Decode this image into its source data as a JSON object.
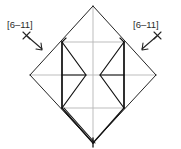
{
  "figure": {
    "type": "origami-folding-step-diagram",
    "background_color": "#ffffff",
    "width": 181,
    "height": 149,
    "stroke_dark": "#1a1a1a",
    "stroke_gray": "#a9a9a9",
    "stroke_mid": "#555555"
  },
  "labels": {
    "left": {
      "text": "[6–11]",
      "x": 7,
      "y": 20
    },
    "right": {
      "text": "[6–11]",
      "x": 133,
      "y": 20
    }
  },
  "annotations": {
    "left_arrow": {
      "name": "repeat-arrow-left",
      "marker": "×",
      "direction": "down-right",
      "from_x": 25,
      "from_y": 34,
      "to_x": 43,
      "to_y": 50
    },
    "right_arrow": {
      "name": "repeat-arrow-right",
      "marker": "×",
      "direction": "down-left",
      "from_x": 155,
      "from_y": 34,
      "to_x": 137,
      "to_y": 50
    }
  },
  "geometry": {
    "outer_diamond": {
      "top": [
        93,
        6
      ],
      "right": [
        156,
        75
      ],
      "bottom": [
        93,
        143
      ],
      "left": [
        30,
        75
      ]
    },
    "construction_lines_color": "#b5b5b5",
    "construction_lines": [
      {
        "name": "vertical-center",
        "x1": 93,
        "y1": 6,
        "x2": 93,
        "y2": 143
      },
      {
        "name": "horizontal-center",
        "x1": 30,
        "y1": 75,
        "x2": 156,
        "y2": 75
      },
      {
        "name": "upper-horizontal",
        "x1": 62,
        "y1": 42,
        "x2": 124,
        "y2": 42
      },
      {
        "name": "lower-horizontal",
        "x1": 62,
        "y1": 108,
        "x2": 124,
        "y2": 108
      },
      {
        "name": "left-vertical",
        "x1": 62,
        "y1": 42,
        "x2": 62,
        "y2": 108
      },
      {
        "name": "right-vertical",
        "x1": 124,
        "y1": 42,
        "x2": 124,
        "y2": 108
      }
    ],
    "left_flap": {
      "spine": {
        "x1": 62,
        "y1": 42,
        "x2": 62,
        "y2": 108
      },
      "kite_outer": [
        [
          62,
          42
        ],
        [
          86,
          75
        ],
        [
          62,
          108
        ]
      ],
      "kite_mid_line": {
        "x1": 62,
        "y1": 75,
        "x2": 86,
        "y2": 75
      }
    },
    "right_flap": {
      "spine": {
        "x1": 124,
        "y1": 42,
        "x2": 124,
        "y2": 108
      },
      "kite_outer": [
        [
          124,
          42
        ],
        [
          100,
          75
        ],
        [
          124,
          108
        ]
      ],
      "kite_mid_line": {
        "x1": 124,
        "y1": 75,
        "x2": 100,
        "y2": 75
      }
    },
    "doubled_edges": [
      {
        "name": "bottom-left-edge-double",
        "x1": 62,
        "y1": 108,
        "x2": 93,
        "y2": 143
      },
      {
        "name": "bottom-apex-double",
        "x1": 93,
        "y1": 139,
        "x2": 93,
        "y2": 147
      }
    ]
  }
}
